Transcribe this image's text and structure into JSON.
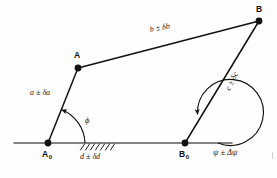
{
  "figure": {
    "kind": "engineering-diagram",
    "width": 277,
    "height": 178,
    "background_color": "#fefefe",
    "ink_color": "#111111"
  },
  "points": {
    "a0": {
      "label": "A",
      "subscript": "0",
      "x": 48,
      "y": 143,
      "dot_radius": 3.4
    },
    "b0": {
      "label": "B",
      "subscript": "0",
      "x": 185,
      "y": 143,
      "dot_radius": 3.4
    },
    "a": {
      "label": "A",
      "subscript": "",
      "x": 78,
      "y": 68,
      "dot_radius": 3.4
    },
    "b": {
      "label": "B",
      "subscript": "",
      "x": 259,
      "y": 21,
      "dot_radius": 3.4
    }
  },
  "links": [
    {
      "name": "crank",
      "from": "a0",
      "to": "a",
      "label": "a ± δa",
      "label_x": 33,
      "label_y": 93
    },
    {
      "name": "coupler",
      "from": "a",
      "to": "b",
      "label": "b ± δb",
      "label_x": 152,
      "label_y": 29
    },
    {
      "name": "rocker",
      "from": "b0",
      "to": "b",
      "label": "c ± δc",
      "label_x": 226,
      "label_y": 78
    },
    {
      "name": "ground",
      "from": "a0",
      "to": "b0",
      "label": "d ± δd",
      "label_x": 80,
      "label_y": 155
    }
  ],
  "ground_line": {
    "x1": 14,
    "x2": 232,
    "y": 143
  },
  "hatching": {
    "x_start": 79,
    "x_end": 113,
    "count": 7,
    "length": 7,
    "lean_deg": 30
  },
  "angles": [
    {
      "name": "phi",
      "at": "a0",
      "label": "ϕ",
      "label_x": 85,
      "label_y": 120,
      "radius": 37,
      "start_deg": 0,
      "end_deg": 68,
      "arrow_at": "end"
    },
    {
      "name": "psi",
      "at": "b0",
      "label": "ψ ± Δψ",
      "label_x": 213,
      "label_y": 149,
      "radius": 33,
      "start_deg": 0,
      "end_deg": 292,
      "arrow_at": "end"
    }
  ]
}
